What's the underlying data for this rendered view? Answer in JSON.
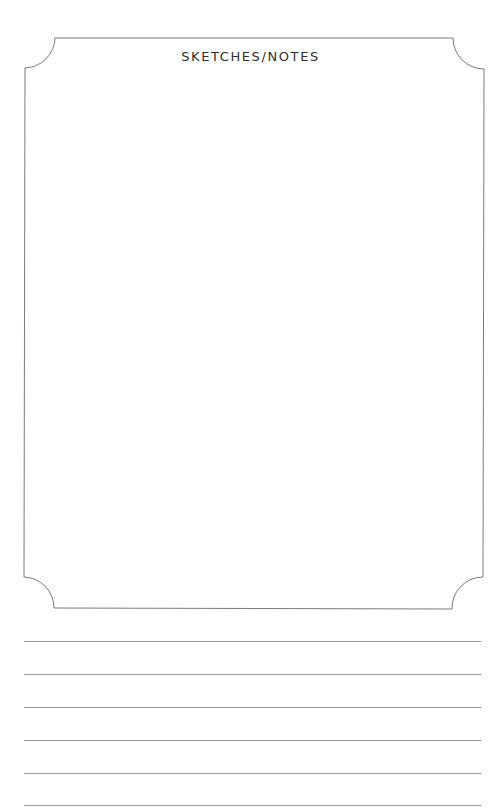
{
  "sketch_box": {
    "title": "SKETCHES/NOTES"
  },
  "lined_area": {
    "line_count": 6
  },
  "colors": {
    "frame_stroke": "#7a7a7a",
    "rule_line": "#9a9a9a",
    "title_text": "#2e2e2e",
    "paper": "#ffffff"
  }
}
